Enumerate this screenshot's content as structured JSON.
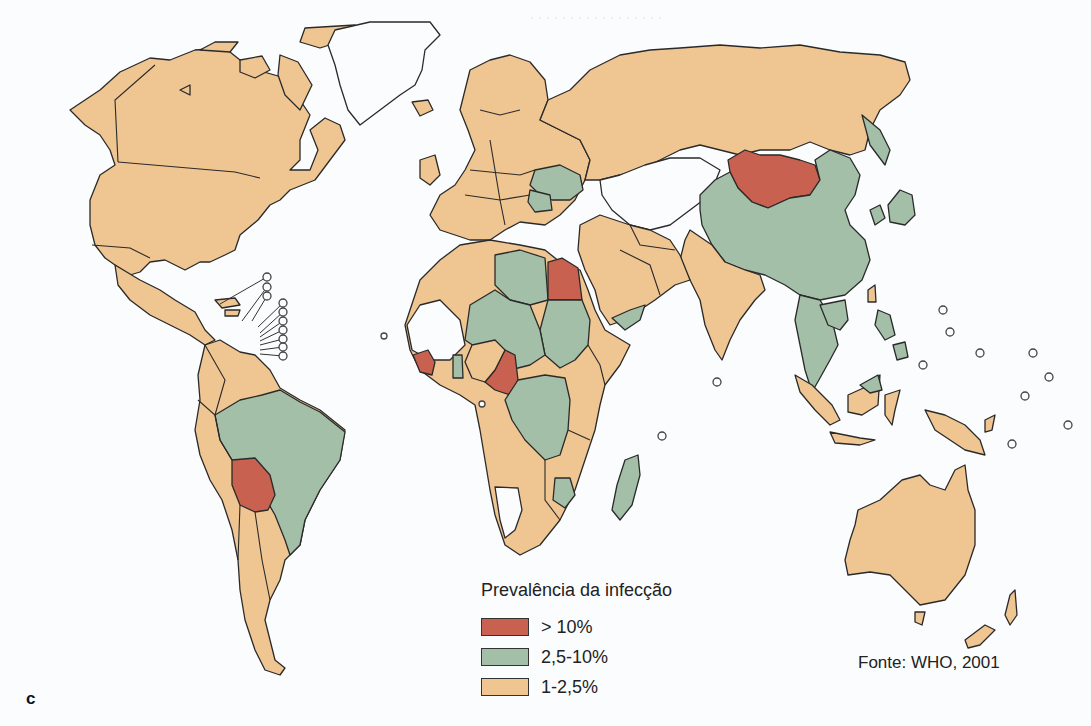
{
  "figure": {
    "panel_label": "c",
    "source": "Fonte: WHO, 2001"
  },
  "legend": {
    "title": "Prevalência da infecção",
    "items": [
      {
        "label": "> 10%",
        "color": "#c8614f"
      },
      {
        "label": "2,5-10%",
        "color": "#a3bfa7"
      },
      {
        "label": "1-2,5%",
        "color": "#efc592"
      }
    ]
  },
  "colors": {
    "high": "#c8614f",
    "medium": "#a3bfa7",
    "low": "#efc592",
    "no_data": "#fbfcfd",
    "outline": "#2a2a2a"
  },
  "regions": {
    "high": [
      "Mongólia",
      "Egito",
      "Bolívia",
      "Camarões",
      "Guiné / Serra Leoa"
    ],
    "medium": [
      "China",
      "Brasil",
      "Líbia",
      "Chade",
      "Sudão",
      "Níger",
      "Congo (RDC)",
      "Madagascar",
      "Ucrânia",
      "Romênia",
      "Iêmen",
      "Tailândia",
      "Filipinas",
      "Japão",
      "Zimbábue"
    ],
    "low": [
      "Estados Unidos",
      "Canadá",
      "México",
      "Rússia",
      "Europa Ocidental",
      "Índia",
      "Austrália",
      "Argentina",
      "Arábia Saudita",
      "Irã",
      "África do Sul",
      "Indonésia"
    ]
  }
}
